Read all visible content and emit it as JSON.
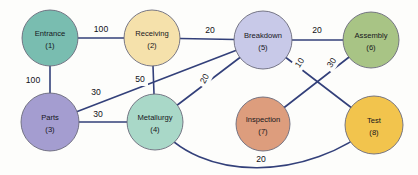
{
  "diagram": {
    "background_color": "#fdfdfb",
    "edge_color": "#33407a",
    "nodes": [
      {
        "id": "1",
        "label": "Entrance",
        "id_label": "(1)",
        "color": "#79bdb0",
        "cx": 50,
        "cy": 38,
        "r": 28
      },
      {
        "id": "2",
        "label": "Receiving",
        "id_label": "(2)",
        "color": "#f5e1ab",
        "cx": 152,
        "cy": 38,
        "r": 28
      },
      {
        "id": "3",
        "label": "Parts",
        "id_label": "(3)",
        "color": "#a49dd0",
        "cx": 50,
        "cy": 122,
        "r": 29
      },
      {
        "id": "4",
        "label": "Metallurgy",
        "id_label": "(4)",
        "color": "#a9d8c8",
        "cx": 155,
        "cy": 122,
        "r": 28
      },
      {
        "id": "5",
        "label": "Breakdown",
        "id_label": "(5)",
        "color": "#c8c9e8",
        "cx": 263,
        "cy": 40,
        "r": 29
      },
      {
        "id": "6",
        "label": "Assembly",
        "id_label": "(6)",
        "color": "#a8c485",
        "cx": 371,
        "cy": 40,
        "r": 28
      },
      {
        "id": "7",
        "label": "Inspection",
        "id_label": "(7)",
        "color": "#dd9d7d",
        "cx": 263,
        "cy": 124,
        "r": 27
      },
      {
        "id": "8",
        "label": "Test",
        "id_label": "(8)",
        "color": "#f2c44d",
        "cx": 374,
        "cy": 125,
        "r": 29
      }
    ],
    "edges": [
      {
        "from": "1",
        "to": "2",
        "weight": "100",
        "label_x": 101,
        "label_y": 30,
        "rotate": 0
      },
      {
        "from": "1",
        "to": "3",
        "weight": "100",
        "label_x": 33,
        "label_y": 81,
        "rotate": 0
      },
      {
        "from": "2",
        "to": "5",
        "weight": "20",
        "label_x": 210,
        "label_y": 31,
        "rotate": 0
      },
      {
        "from": "2",
        "to": "4",
        "weight": "50",
        "label_x": 140,
        "label_y": 80,
        "rotate": 0
      },
      {
        "from": "3",
        "to": "5",
        "weight": "30",
        "label_x": 96,
        "label_y": 93,
        "rotate": 0
      },
      {
        "from": "3",
        "to": "4",
        "weight": "30",
        "label_x": 98,
        "label_y": 115,
        "rotate": 0
      },
      {
        "from": "4",
        "to": "5",
        "weight": "20",
        "label_x": 205,
        "label_y": 79,
        "rotate": -62
      },
      {
        "from": "5",
        "to": "6",
        "weight": "20",
        "label_x": 317,
        "label_y": 31,
        "rotate": 0
      },
      {
        "from": "5",
        "to": "8",
        "weight": "10",
        "label_x": 300,
        "label_y": 63,
        "rotate": -57
      },
      {
        "from": "7",
        "to": "6",
        "weight": "30",
        "label_x": 332,
        "label_y": 63,
        "rotate": -57
      },
      {
        "from": "4",
        "to": "8",
        "weight": "20",
        "label_x": 261,
        "label_y": 160,
        "rotate": 0
      }
    ]
  }
}
